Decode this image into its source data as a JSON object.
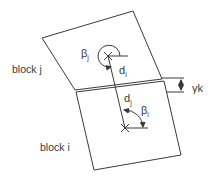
{
  "diagram": {
    "labels": {
      "block_j": "block j",
      "block_i": "block i",
      "beta_j": "β",
      "beta_j_sub": "j",
      "beta_i": "β",
      "beta_i_sub": "i",
      "d_i": "d",
      "d_i_sub": "i",
      "d_j": "d",
      "d_j_sub": "j",
      "gamma_k": "γk"
    },
    "colors": {
      "line": "#3a3a3a",
      "background": "#ffffff"
    }
  }
}
